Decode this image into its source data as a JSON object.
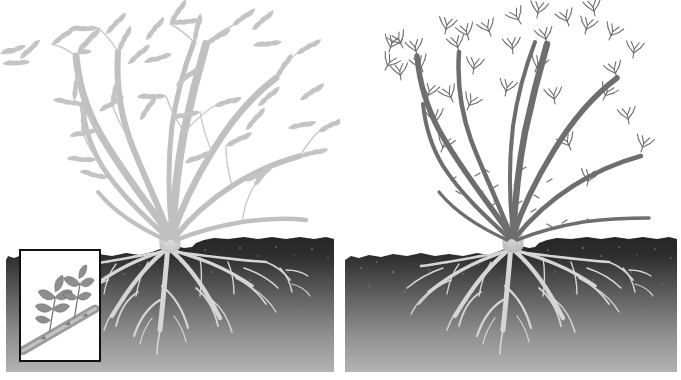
{
  "figure": {
    "type": "botanical-illustration",
    "panel_count": 2,
    "background_color": "#ffffff"
  },
  "panels": [
    {
      "id": "left",
      "name": "leafed-out-shrub",
      "stage_label": "",
      "cane_color": "#c0c0c0",
      "foliage_color": "#c4c4c4",
      "foliage_state": "full compound leaves",
      "cane_count": 9,
      "leaf_cluster_count": 42,
      "inset": {
        "name": "cane-with-leafy-shoots",
        "caption": "",
        "cane_color": "#8c8c8c",
        "shoot_count": 2,
        "description": "Cane section bearing two developed leafy shoots with pinnate leaflets"
      },
      "soil": {
        "top_color": "#2b2b2b",
        "bottom_color": "#b3b3b3",
        "root_color": "#d6d6d6",
        "crown_visible": true
      }
    },
    {
      "id": "right",
      "name": "budding-shrub",
      "stage_label": "",
      "cane_color": "#6e6e6e",
      "foliage_color": "#707070",
      "foliage_state": "sparse emerging sprouts",
      "cane_count": 9,
      "leaf_cluster_count": 34,
      "inset": {
        "name": "cane-with-emerging-buds",
        "caption": "",
        "cane_color": "#8c8c8c",
        "shoot_count": 2,
        "description": "Cane section bearing two small emerging bud clusters"
      },
      "soil": {
        "top_color": "#2b2b2b",
        "bottom_color": "#b3b3b3",
        "root_color": "#d6d6d6",
        "crown_visible": true
      }
    }
  ],
  "colors": {
    "background": "#ffffff",
    "soil_dark": "#2b2b2b",
    "soil_light": "#b3b3b3",
    "root_light": "#d6d6d6",
    "cane_light": "#c0c0c0",
    "cane_dark": "#6e6e6e",
    "inset_border": "#111111"
  }
}
